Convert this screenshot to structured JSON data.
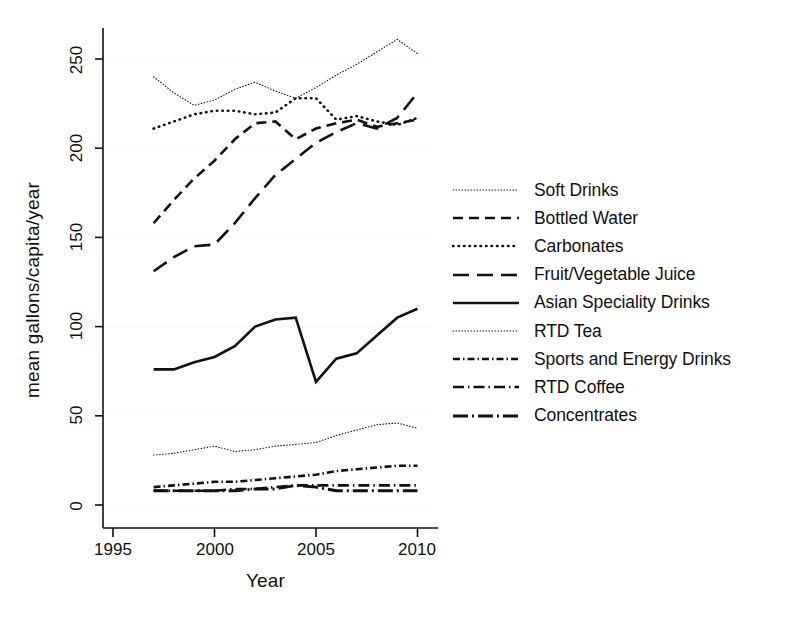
{
  "chart_data": {
    "type": "line",
    "title": "",
    "xlabel": "Year",
    "ylabel": "mean gallons/capita/year",
    "xlim": [
      1994.2,
      2011.3
    ],
    "ylim": [
      -14,
      272
    ],
    "xticks": [
      1995,
      2000,
      2005,
      2010
    ],
    "yticks": [
      0,
      50,
      100,
      150,
      200,
      250
    ],
    "grid": "horizontal-faint",
    "legend_position": "right",
    "x": [
      1997,
      1998,
      1999,
      2000,
      2001,
      2002,
      2003,
      2004,
      2005,
      2006,
      2007,
      2008,
      2009,
      2010
    ],
    "series": [
      {
        "name": "Soft Drinks",
        "style": "dotted-fine",
        "values": [
          240,
          231,
          224,
          227,
          233,
          237,
          232,
          228,
          234,
          241,
          247,
          254,
          261,
          253
        ]
      },
      {
        "name": "Bottled Water",
        "style": "dashed",
        "values": [
          158,
          171,
          183,
          193,
          205,
          214,
          215,
          205,
          211,
          214,
          216,
          212,
          214,
          216
        ]
      },
      {
        "name": "Carbonates",
        "style": "dotted",
        "values": [
          211,
          215,
          219,
          221,
          221,
          219,
          220,
          228,
          228,
          216,
          218,
          215,
          213,
          217
        ]
      },
      {
        "name": "Fruit/Vegetable Juice",
        "style": "long-dashed",
        "values": [
          131,
          139,
          145,
          146,
          158,
          172,
          185,
          194,
          203,
          209,
          214,
          211,
          217,
          231
        ]
      },
      {
        "name": "Asian Speciality Drinks",
        "style": "solid",
        "values": [
          76,
          76,
          80,
          83,
          89,
          100,
          104,
          105,
          69,
          82,
          85,
          95,
          105,
          110
        ]
      },
      {
        "name": "RTD Tea",
        "style": "dotted-fine",
        "values": [
          28,
          29,
          31,
          33,
          30,
          31,
          33,
          34,
          35,
          39,
          42,
          45,
          46,
          43
        ]
      },
      {
        "name": "Sports and Energy Drinks",
        "style": "dash-dot-dot",
        "values": [
          10,
          11,
          12,
          13,
          13,
          14,
          15,
          16,
          17,
          19,
          20,
          21,
          22,
          22
        ]
      },
      {
        "name": "RTD Coffee",
        "style": "dash-dot",
        "values": [
          8,
          8,
          8,
          8,
          9,
          9,
          10,
          11,
          11,
          11,
          11,
          11,
          11,
          11
        ]
      },
      {
        "name": "Concentrates",
        "style": "long-dash-dot",
        "values": [
          8,
          8,
          8,
          8,
          8,
          9,
          9,
          11,
          10,
          8,
          8,
          8,
          8,
          8
        ]
      }
    ]
  },
  "axes": {
    "xlabel": "Year",
    "ylabel": "mean gallons/capita/year",
    "xticks": [
      "1995",
      "2000",
      "2005",
      "2010"
    ],
    "yticks": [
      "250",
      "200",
      "150",
      "100",
      "50",
      "0"
    ]
  },
  "legend": {
    "items": [
      {
        "label": "Soft Drinks"
      },
      {
        "label": "Bottled Water"
      },
      {
        "label": "Carbonates"
      },
      {
        "label": "Fruit/Vegetable Juice"
      },
      {
        "label": "Asian Speciality Drinks"
      },
      {
        "label": "RTD Tea"
      },
      {
        "label": "Sports and Energy Drinks"
      },
      {
        "label": "RTD Coffee"
      },
      {
        "label": "Concentrates"
      }
    ]
  },
  "colors": {
    "ink": "#111111",
    "background": "#ffffff",
    "grid": "#e8e8e8"
  }
}
